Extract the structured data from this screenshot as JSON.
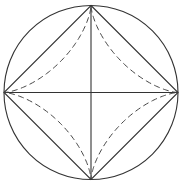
{
  "diagram": {
    "elements": [
      {
        "id": "circle",
        "style": "solid"
      },
      {
        "id": "inscribed-square",
        "style": "solid"
      },
      {
        "id": "horizontal-diameter",
        "style": "solid"
      },
      {
        "id": "vertical-diameter",
        "style": "solid"
      },
      {
        "id": "astroid",
        "style": "dashed",
        "cusps": 4
      }
    ],
    "colors": {
      "line": "#333333",
      "dashed": "#444444",
      "background": "#ffffff"
    }
  }
}
